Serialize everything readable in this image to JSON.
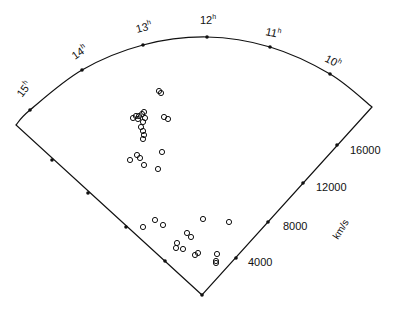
{
  "chart_data": {
    "type": "scatter",
    "subtype": "redshift-wedge (cone) diagram",
    "title": "",
    "angular_axis": {
      "label_unit": "h",
      "ticks": [
        {
          "label": "15",
          "x": 30,
          "y": 110,
          "lx": 22,
          "ly": 98,
          "rot": -52
        },
        {
          "label": "14",
          "x": 82,
          "y": 70,
          "lx": 75,
          "ly": 60,
          "rot": -35
        },
        {
          "label": "13",
          "x": 143,
          "y": 45,
          "lx": 137,
          "ly": 33,
          "rot": -15
        },
        {
          "label": "12",
          "x": 207,
          "y": 37,
          "lx": 200,
          "ly": 24,
          "rot": 0
        },
        {
          "label": "11",
          "x": 270,
          "y": 47,
          "lx": 265,
          "ly": 35,
          "rot": 12
        },
        {
          "label": "10",
          "x": 330,
          "y": 74,
          "lx": 324,
          "ly": 61,
          "rot": 28
        }
      ]
    },
    "radial_axis": {
      "label": "km/s",
      "ticks": [
        {
          "label": "4000",
          "x": 236,
          "y": 258,
          "lx": 248,
          "ly": 266
        },
        {
          "label": "8000",
          "x": 268,
          "y": 222,
          "lx": 283,
          "ly": 230
        },
        {
          "label": "12000",
          "x": 303,
          "y": 183,
          "lx": 316,
          "ly": 191
        },
        {
          "label": "16000",
          "x": 337,
          "y": 145,
          "lx": 350,
          "ly": 154
        }
      ],
      "range": [
        0,
        19000
      ]
    },
    "geometry": {
      "apex": [
        202,
        295
      ],
      "left_corner": [
        16,
        125
      ],
      "right_corner": [
        372,
        107
      ],
      "arc_top": [
        207,
        37
      ],
      "left_edge_ticks": [
        [
          52,
          160
        ],
        [
          88,
          193
        ],
        [
          126,
          227
        ],
        [
          165,
          261
        ]
      ]
    },
    "points": [
      [
        159,
        91
      ],
      [
        161,
        93
      ],
      [
        133,
        118
      ],
      [
        136,
        116
      ],
      [
        139,
        116
      ],
      [
        142,
        114
      ],
      [
        144,
        112
      ],
      [
        145,
        118
      ],
      [
        143,
        122
      ],
      [
        138,
        119
      ],
      [
        164,
        117
      ],
      [
        168,
        119
      ],
      [
        141,
        127
      ],
      [
        143,
        131
      ],
      [
        144,
        135
      ],
      [
        143,
        139
      ],
      [
        130,
        160
      ],
      [
        137,
        155
      ],
      [
        140,
        158
      ],
      [
        144,
        165
      ],
      [
        162,
        152
      ],
      [
        158,
        169
      ],
      [
        143,
        227
      ],
      [
        155,
        220
      ],
      [
        163,
        225
      ],
      [
        187,
        233
      ],
      [
        191,
        237
      ],
      [
        203,
        219
      ],
      [
        229,
        222
      ],
      [
        177,
        243
      ],
      [
        176,
        248
      ],
      [
        183,
        249
      ],
      [
        195,
        255
      ],
      [
        198,
        253
      ],
      [
        217,
        254
      ],
      [
        216,
        261
      ],
      [
        216,
        263
      ]
    ],
    "marker": "open-circle",
    "colors": {
      "line": "#111111",
      "marker": "#111111",
      "background": "#ffffff"
    }
  }
}
